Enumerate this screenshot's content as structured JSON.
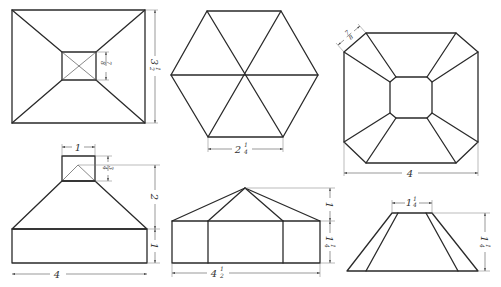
{
  "figures": [
    {
      "id": "rect-pyramid-top",
      "view": "top",
      "shape": "rectangular frustum with square opening",
      "dimensions": [
        {
          "name": "inner-height",
          "whole": "",
          "num": "7",
          "den": "8",
          "text": "7/8"
        },
        {
          "name": "outer-height",
          "whole": "3",
          "num": "1",
          "den": "2",
          "text": "3 1/2"
        }
      ]
    },
    {
      "id": "hexagon-top",
      "view": "top",
      "shape": "hexagonal pyramid",
      "dimensions": [
        {
          "name": "edge",
          "whole": "2",
          "num": "1",
          "den": "4",
          "text": "2 1/4"
        }
      ]
    },
    {
      "id": "octagon-top",
      "view": "top",
      "shape": "octagonal frustum",
      "dimensions": [
        {
          "name": "chamfer",
          "whole": "",
          "num": "7",
          "den": "8",
          "text": "7/8"
        },
        {
          "name": "width",
          "whole": "4",
          "num": "",
          "den": "",
          "text": "4"
        }
      ]
    },
    {
      "id": "rect-pyramid-front",
      "view": "front",
      "dimensions": [
        {
          "name": "top-width",
          "whole": "1",
          "num": "",
          "den": "",
          "text": "1"
        },
        {
          "name": "top-height",
          "whole": "",
          "num": "3",
          "den": "4",
          "text": "3/4"
        },
        {
          "name": "slope-height",
          "whole": "2",
          "num": "",
          "den": "",
          "text": "2"
        },
        {
          "name": "base-height",
          "whole": "1",
          "num": "",
          "den": "",
          "text": "1"
        },
        {
          "name": "base-width",
          "whole": "4",
          "num": "",
          "den": "",
          "text": "4"
        }
      ]
    },
    {
      "id": "hexagon-front",
      "view": "front",
      "dimensions": [
        {
          "name": "roof-height",
          "whole": "1",
          "num": "",
          "den": "",
          "text": "1"
        },
        {
          "name": "wall-height",
          "whole": "1",
          "num": "1",
          "den": "4",
          "text": "1 1/4"
        },
        {
          "name": "width",
          "whole": "4",
          "num": "1",
          "den": "2",
          "text": "4 1/2"
        }
      ]
    },
    {
      "id": "octagon-front",
      "view": "front",
      "dimensions": [
        {
          "name": "top-width",
          "whole": "1",
          "num": "1",
          "den": "4",
          "text": "1 1/4"
        },
        {
          "name": "height",
          "whole": "1",
          "num": "1",
          "den": "4",
          "text": "1 1/4"
        }
      ]
    }
  ]
}
